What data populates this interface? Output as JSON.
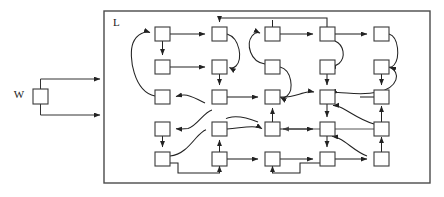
{
  "figure": {
    "title": "",
    "type": "block-diagram",
    "width": 444,
    "height": 197,
    "background_color": "#ffffff"
  },
  "labels": {
    "outer_block": "W",
    "inner_block": "L"
  },
  "colors": {
    "node_stroke": "#3a3a3a",
    "node_fill": "#ffffff",
    "frame_stroke": "#4a4a4a",
    "edge_stroke": "#222222",
    "text": "#1a1a1a"
  },
  "outer_node": {
    "name": "W",
    "x": 33,
    "y": 89,
    "w": 15,
    "h": 15,
    "label_x": 20,
    "label_y": 97
  },
  "inner_frame": {
    "name": "L",
    "x": 104,
    "y": 11,
    "w": 326,
    "h": 172,
    "label_x": 113,
    "label_y": 25
  },
  "grid": {
    "columns_x": [
      155,
      212,
      265,
      320,
      374
    ],
    "rows_y": [
      27,
      60,
      90,
      122,
      152
    ],
    "node_w": 15,
    "node_h": 14,
    "row_count": 5,
    "column_count": 5
  },
  "nodes": [
    {
      "id": "r1c1",
      "row": 1,
      "col": 1,
      "x": 155,
      "y": 27
    },
    {
      "id": "r1c2",
      "row": 1,
      "col": 2,
      "x": 212,
      "y": 27
    },
    {
      "id": "r1c3",
      "row": 1,
      "col": 3,
      "x": 265,
      "y": 27
    },
    {
      "id": "r1c4",
      "row": 1,
      "col": 4,
      "x": 320,
      "y": 27
    },
    {
      "id": "r1c5",
      "row": 1,
      "col": 5,
      "x": 374,
      "y": 27
    },
    {
      "id": "r2c1",
      "row": 2,
      "col": 1,
      "x": 155,
      "y": 60
    },
    {
      "id": "r2c2",
      "row": 2,
      "col": 2,
      "x": 212,
      "y": 60
    },
    {
      "id": "r2c3",
      "row": 2,
      "col": 3,
      "x": 265,
      "y": 60
    },
    {
      "id": "r2c4",
      "row": 2,
      "col": 4,
      "x": 320,
      "y": 60
    },
    {
      "id": "r2c5",
      "row": 2,
      "col": 5,
      "x": 374,
      "y": 60
    },
    {
      "id": "r3c1",
      "row": 3,
      "col": 1,
      "x": 155,
      "y": 90
    },
    {
      "id": "r3c2",
      "row": 3,
      "col": 2,
      "x": 212,
      "y": 90
    },
    {
      "id": "r3c3",
      "row": 3,
      "col": 3,
      "x": 265,
      "y": 90
    },
    {
      "id": "r3c4",
      "row": 3,
      "col": 4,
      "x": 320,
      "y": 90
    },
    {
      "id": "r3c5",
      "row": 3,
      "col": 5,
      "x": 374,
      "y": 90
    },
    {
      "id": "r4c1",
      "row": 4,
      "col": 1,
      "x": 155,
      "y": 122
    },
    {
      "id": "r4c2",
      "row": 4,
      "col": 2,
      "x": 212,
      "y": 122
    },
    {
      "id": "r4c3",
      "row": 4,
      "col": 3,
      "x": 265,
      "y": 122
    },
    {
      "id": "r4c4",
      "row": 4,
      "col": 4,
      "x": 320,
      "y": 122
    },
    {
      "id": "r4c5",
      "row": 4,
      "col": 5,
      "x": 374,
      "y": 122
    },
    {
      "id": "r5c1",
      "row": 5,
      "col": 1,
      "x": 155,
      "y": 152
    },
    {
      "id": "r5c2",
      "row": 5,
      "col": 2,
      "x": 212,
      "y": 152
    },
    {
      "id": "r5c3",
      "row": 5,
      "col": 3,
      "x": 265,
      "y": 152
    },
    {
      "id": "r5c4",
      "row": 5,
      "col": 4,
      "x": 320,
      "y": 152
    },
    {
      "id": "r5c5",
      "row": 5,
      "col": 5,
      "x": 374,
      "y": 152
    }
  ],
  "input_leads": [
    {
      "id": "lead-top",
      "from": "W",
      "to": "L",
      "direction": "right"
    },
    {
      "id": "lead-bottom",
      "from": "W",
      "to": "L",
      "direction": "right"
    }
  ],
  "edge_count": 34,
  "edge_style": {
    "arrowhead": "filled-triangle",
    "curved": true
  }
}
